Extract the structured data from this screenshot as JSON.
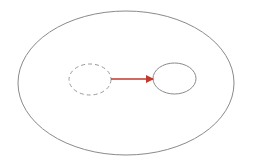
{
  "diagram": {
    "colors": {
      "outline": "#8a8a8a",
      "dashed": "#9a9a9a",
      "arrow": "#c0392b",
      "background": "#ffffff"
    },
    "outer_region": {
      "cx": 126,
      "cy": 83,
      "rx": 108,
      "ry": 72
    },
    "original_shape": {
      "cx": 90,
      "cy": 79.5,
      "rx": 21,
      "ry": 15.5,
      "style": "dashed"
    },
    "moved_shape": {
      "cx": 174.5,
      "cy": 78.5,
      "rx": 21.5,
      "ry": 15.5,
      "style": "solid"
    },
    "arrow": {
      "x1": 111,
      "y1": 79,
      "x2": 153,
      "y2": 79
    }
  }
}
